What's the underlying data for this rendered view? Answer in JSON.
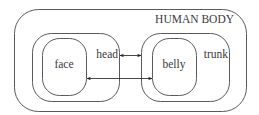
{
  "diagram": {
    "type": "nested-containment-diagram",
    "stroke_color": "#5a5a5a",
    "background": "#ffffff",
    "nodes": [
      {
        "id": "human-body",
        "label": "HUMAN BODY",
        "parent": null
      },
      {
        "id": "head",
        "label": "head",
        "parent": "human-body"
      },
      {
        "id": "face",
        "label": "face",
        "parent": "head"
      },
      {
        "id": "trunk",
        "label": "trunk",
        "parent": "human-body"
      },
      {
        "id": "belly",
        "label": "belly",
        "parent": "trunk"
      }
    ],
    "edges": [
      {
        "from": "head",
        "to": "trunk",
        "direction": "bidirectional"
      },
      {
        "from": "face",
        "to": "belly",
        "direction": "bidirectional"
      }
    ]
  },
  "labels": {
    "body": "HUMAN BODY",
    "head": "head",
    "face": "face",
    "trunk": "trunk",
    "belly": "belly"
  }
}
